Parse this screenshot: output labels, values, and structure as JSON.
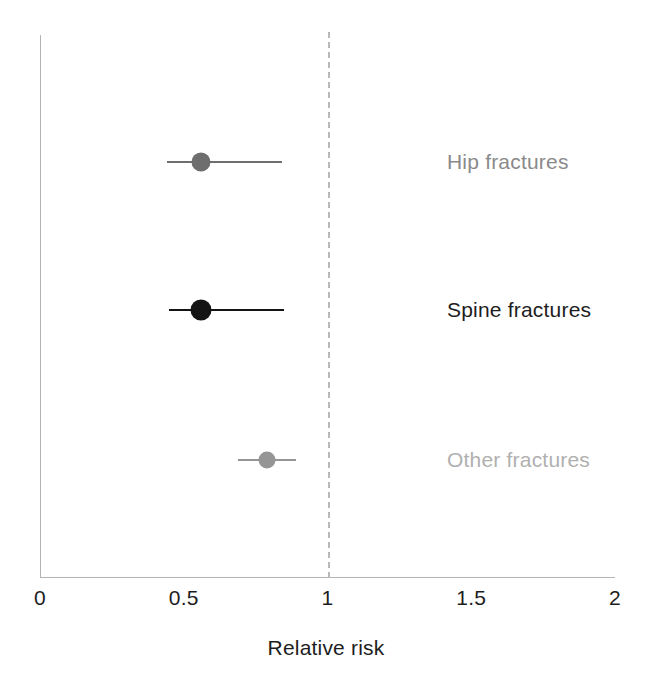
{
  "chart_data": {
    "type": "scatter",
    "subtype": "forest-plot",
    "title": "",
    "xlabel": "Relative risk",
    "ylabel": "",
    "xlim": [
      0,
      2
    ],
    "xticks": [
      {
        "value": 0,
        "label": "0"
      },
      {
        "value": 0.5,
        "label": "0.5"
      },
      {
        "value": 1,
        "label": "1"
      },
      {
        "value": 1.5,
        "label": "1.5"
      },
      {
        "value": 2,
        "label": "2"
      }
    ],
    "grid": false,
    "legend": "none",
    "reference_line": {
      "value": 1,
      "style": "dashed",
      "color": "#b9b9b9"
    },
    "categories": [
      "Hip fractures",
      "Spine fractures",
      "Other fractures"
    ],
    "points": [
      {
        "label": "Hip fractures",
        "estimate": 0.56,
        "ci_low": 0.44,
        "ci_high": 0.84,
        "color": "#6e6e6e",
        "label_color": "#8a8a8a",
        "marker_size": 19
      },
      {
        "label": "Spine fractures",
        "estimate": 0.56,
        "ci_low": 0.45,
        "ci_high": 0.85,
        "color": "#141414",
        "label_color": "#1d1d1d",
        "marker_size": 21
      },
      {
        "label": "Other fractures",
        "estimate": 0.79,
        "ci_low": 0.69,
        "ci_high": 0.89,
        "color": "#959595",
        "label_color": "#b0b0b0",
        "marker_size": 17
      }
    ],
    "axis_color": "#b4b4b4",
    "background": "#ffffff"
  },
  "layout": {
    "x0_px": 40,
    "x_per_unit_px": 287.5,
    "row_y_px": [
      162,
      310,
      460
    ]
  }
}
